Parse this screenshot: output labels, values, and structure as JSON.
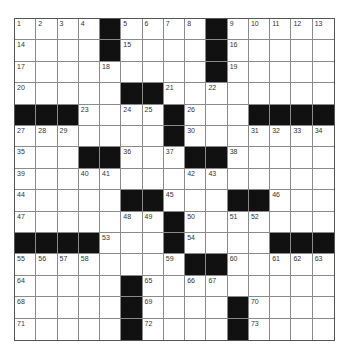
{
  "puzzle": {
    "rows": 15,
    "cols": 15,
    "grid": [
      [
        "1",
        "2",
        "3",
        "4",
        "#",
        "5",
        "6",
        "7",
        "8",
        "#",
        "9",
        "10",
        "11",
        "12",
        "13"
      ],
      [
        "14",
        "",
        "",
        "",
        "#",
        "15",
        "",
        "",
        "",
        "#",
        "16",
        "",
        "",
        "",
        ""
      ],
      [
        "17",
        "",
        "",
        "",
        "18",
        "",
        "",
        "",
        "",
        "#",
        "19",
        "",
        "",
        "",
        ""
      ],
      [
        "20",
        "",
        "",
        "",
        "",
        "#",
        "#",
        "21",
        "",
        "22",
        "",
        "",
        "",
        "",
        ""
      ],
      [
        "#",
        "#",
        "#",
        "23",
        "",
        "24",
        "25",
        "#",
        "26",
        "",
        "",
        "#",
        "#",
        "#",
        "#"
      ],
      [
        "27",
        "28",
        "29",
        "",
        "",
        "",
        "",
        "#",
        "30",
        "",
        "",
        "31",
        "32",
        "33",
        "34"
      ],
      [
        "35",
        "",
        "",
        "#",
        "#",
        "36",
        "",
        "37",
        "#",
        "#",
        "38",
        "",
        "",
        "",
        ""
      ],
      [
        "39",
        "",
        "",
        "40",
        "41",
        "",
        "",
        "",
        "42",
        "43",
        "",
        "",
        "",
        "",
        ""
      ],
      [
        "44",
        "",
        "",
        "",
        "",
        "#",
        "#",
        "45",
        "",
        "",
        "#",
        "#",
        "46",
        "",
        ""
      ],
      [
        "47",
        "",
        "",
        "",
        "",
        "48",
        "49",
        "#",
        "50",
        "",
        "51",
        "52",
        "",
        "",
        ""
      ],
      [
        "#",
        "#",
        "#",
        "#",
        "53",
        "",
        "",
        "#",
        "54",
        "",
        "",
        "",
        "#",
        "#",
        "#"
      ],
      [
        "55",
        "56",
        "57",
        "58",
        "",
        "",
        "",
        "59",
        "#",
        "#",
        "60",
        "",
        "61",
        "62",
        "63"
      ],
      [
        "64",
        "",
        "",
        "",
        "",
        "#",
        "65",
        "",
        "66",
        "67",
        "",
        "",
        "",
        "",
        ""
      ],
      [
        "68",
        "",
        "",
        "",
        "",
        "#",
        "69",
        "",
        "",
        "",
        "#",
        "70",
        "",
        "",
        ""
      ],
      [
        "71",
        "",
        "",
        "",
        "",
        "#",
        "72",
        "",
        "",
        "",
        "#",
        "73",
        "",
        "",
        ""
      ]
    ]
  }
}
